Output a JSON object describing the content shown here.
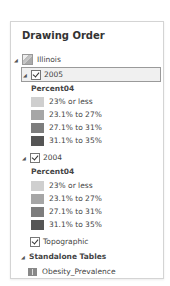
{
  "panel": {
    "title": "Drawing Order",
    "map": {
      "label": "Illinois",
      "layers": [
        {
          "label": "2005",
          "checked": true,
          "selected": true,
          "field": "Percent04",
          "classes": [
            {
              "label": "23% or less",
              "color": "#cfcfcf"
            },
            {
              "label": "23.1% to 27%",
              "color": "#a6a6a6"
            },
            {
              "label": "27.1% to 31%",
              "color": "#7d7d7d"
            },
            {
              "label": "31.1% to 35%",
              "color": "#555555"
            }
          ]
        },
        {
          "label": "2004",
          "checked": true,
          "selected": false,
          "field": "Percent04",
          "classes": [
            {
              "label": "23% or less",
              "color": "#cfcfcf"
            },
            {
              "label": "23.1% to 27%",
              "color": "#a6a6a6"
            },
            {
              "label": "27.1% to 31%",
              "color": "#7d7d7d"
            },
            {
              "label": "31.1% to 35%",
              "color": "#555555"
            }
          ]
        },
        {
          "label": "Topographic",
          "checked": true
        }
      ]
    },
    "standalone_tables": {
      "label": "Standalone Tables",
      "items": [
        {
          "label": "Obesity_Prevalence"
        }
      ]
    }
  },
  "icons": {
    "expander": "▲"
  }
}
